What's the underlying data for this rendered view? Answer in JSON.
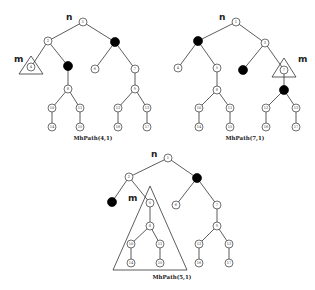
{
  "header_fragment": "··· ···",
  "trees": [
    {
      "caption": "MhPath(4,1)",
      "n_label": "n",
      "m_label": "m",
      "marked_node": "4",
      "black_nodes": [
        "3",
        "5"
      ],
      "node_labels": {
        "1": "1",
        "2": "2",
        "3": "",
        "4": "4",
        "5": "",
        "6": "6",
        "7": "7",
        "8": "8",
        "9": "9",
        "10": "10",
        "11": "11",
        "12": "12",
        "13": "13",
        "14": "14",
        "15": "15",
        "16": "16",
        "17": "17"
      }
    },
    {
      "caption": "MhPath(7,1)",
      "n_label": "n",
      "m_label": "m",
      "marked_node": "7",
      "black_nodes": [
        "2",
        "6",
        "9"
      ],
      "node_labels": {
        "1": "1",
        "2": "",
        "3": "3",
        "4": "4",
        "5": "5",
        "6": "",
        "7": "7",
        "8": "8",
        "9": "",
        "10": "10",
        "11": "11",
        "12": "12",
        "13": "13",
        "14": "14",
        "15": "15",
        "16": "16",
        "17": "17"
      }
    },
    {
      "caption": "MhPath(5,1)",
      "n_label": "n",
      "m_label": "m",
      "marked_node": "5",
      "black_nodes": [
        "3",
        "4"
      ],
      "node_labels": {
        "1": "1",
        "2": "2",
        "3": "",
        "4": "",
        "5": "5",
        "6": "6",
        "7": "7",
        "8": "8",
        "9": "9",
        "10": "10",
        "11": "11",
        "12": "12",
        "13": "13",
        "14": "14",
        "15": "15",
        "16": "16",
        "17": "17"
      }
    }
  ],
  "tree_structure": {
    "edges": [
      [
        "1",
        "2"
      ],
      [
        "1",
        "3"
      ],
      [
        "2",
        "4"
      ],
      [
        "2",
        "5"
      ],
      [
        "3",
        "6"
      ],
      [
        "3",
        "7"
      ],
      [
        "5",
        "8"
      ],
      [
        "7",
        "9"
      ],
      [
        "8",
        "10"
      ],
      [
        "8",
        "11"
      ],
      [
        "9",
        "12"
      ],
      [
        "9",
        "13"
      ],
      [
        "10",
        "14"
      ],
      [
        "11",
        "15"
      ],
      [
        "12",
        "16"
      ],
      [
        "13",
        "17"
      ]
    ]
  }
}
